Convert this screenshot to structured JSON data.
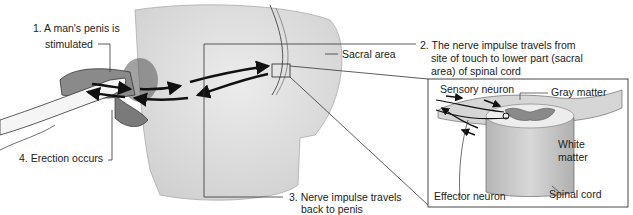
{
  "diagram": {
    "labels": {
      "step1_line1": "1. A man's penis is",
      "step1_line2": "stimulated",
      "step2_line1": "2. The nerve impulse travels from",
      "step2_line2": "site of touch to lower part (sacral",
      "step2_line3": "area) of spinal cord",
      "step3_line1": "3. Nerve impulse travels",
      "step3_line2": "back to penis",
      "step4": "4. Erection occurs",
      "sacral_area": "Sacral area",
      "sensory_neuron": "Sensory neuron",
      "gray_matter": "Gray matter",
      "white_matter_line1": "White",
      "white_matter_line2": "matter",
      "effector_neuron": "Effector neuron",
      "spinal_cord": "Spinal cord"
    },
    "colors": {
      "body_fill": "#e4e4e4",
      "cord_fill": "#c9c9c9",
      "line": "#222222",
      "inset_border": "#333333"
    }
  }
}
